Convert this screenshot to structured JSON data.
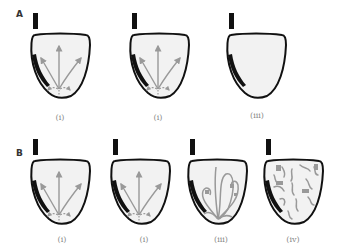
{
  "panels": [
    {
      "letter": "A",
      "items": [
        {
          "label": "(i)",
          "pattern": "focal-radial-arrows"
        },
        {
          "label": "(i)",
          "pattern": "focal-radial-arrows"
        },
        {
          "label": "(iii)",
          "pattern": "none"
        }
      ]
    },
    {
      "letter": "B",
      "items": [
        {
          "label": "(i)",
          "pattern": "focal-radial-arrows"
        },
        {
          "label": "(i)",
          "pattern": "focal-radial-arrows"
        },
        {
          "label": "(iii)",
          "pattern": "reentrant-loops"
        },
        {
          "label": "(iv)",
          "pattern": "fragmented-wavelets"
        }
      ]
    }
  ],
  "colors": {
    "outline": "#111111",
    "fill": "#f2f2f2",
    "arrow": "#999999",
    "scar": "#111111",
    "bar": "#111111"
  }
}
